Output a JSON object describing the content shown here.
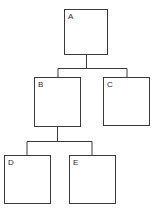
{
  "diagram": {
    "type": "tree",
    "title": "",
    "background_color": "#ffffff",
    "stroke_color": "#3a3a3a",
    "label_color": "#2b2b2b",
    "stroke_width": 1,
    "nodes": [
      {
        "id": "A",
        "label": "A",
        "x": 64,
        "y": 9,
        "width": 44,
        "height": 46,
        "parent": null
      },
      {
        "id": "B",
        "label": "B",
        "x": 34,
        "y": 77,
        "width": 47,
        "height": 50,
        "parent": "A"
      },
      {
        "id": "C",
        "label": "C",
        "x": 103,
        "y": 77,
        "width": 47,
        "height": 49,
        "parent": "A"
      },
      {
        "id": "D",
        "label": "D",
        "x": 4,
        "y": 155,
        "width": 47,
        "height": 49,
        "parent": "B"
      },
      {
        "id": "E",
        "label": "E",
        "x": 69,
        "y": 155,
        "width": 47,
        "height": 49,
        "parent": "B"
      }
    ],
    "edges": [
      {
        "from": "A",
        "to": "B"
      },
      {
        "from": "A",
        "to": "C"
      },
      {
        "from": "B",
        "to": "D"
      },
      {
        "from": "B",
        "to": "E"
      }
    ],
    "connector_buses": [
      {
        "name": "bus-a-children",
        "y": 68,
        "x1": 58,
        "x2": 127
      },
      {
        "name": "bus-b-children",
        "y": 141,
        "x1": 27,
        "x2": 92
      }
    ]
  }
}
